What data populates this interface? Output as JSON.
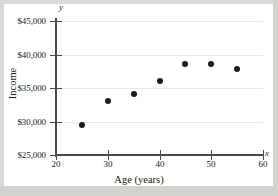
{
  "chart_data": {
    "type": "scatter",
    "title": "",
    "xlabel": "Age (years)",
    "ylabel": "Income",
    "xlim": [
      20,
      60
    ],
    "ylim": [
      25000,
      45000
    ],
    "xticks": [
      20,
      30,
      40,
      50,
      60
    ],
    "yticks": [
      25000,
      30000,
      35000,
      40000,
      45000
    ],
    "xtick_labels": [
      "20",
      "30",
      "40",
      "50",
      "60"
    ],
    "ytick_labels": [
      "$25,000",
      "$30,000",
      "$35,000",
      "$40,000",
      "$45,000"
    ],
    "grid": "horizontal",
    "legend": null,
    "axis_letters": {
      "x": "x",
      "y": "y"
    },
    "marker": {
      "shape": "circle",
      "color": "#1c1c1c",
      "size": 6
    },
    "points": [
      {
        "x": 25,
        "y": 29500
      },
      {
        "x": 30,
        "y": 33100
      },
      {
        "x": 35,
        "y": 34100
      },
      {
        "x": 40,
        "y": 36100
      },
      {
        "x": 45,
        "y": 38600
      },
      {
        "x": 50,
        "y": 38550
      },
      {
        "x": 55,
        "y": 37800
      }
    ]
  },
  "colors": {
    "plot_background": "#ffffff",
    "page_background": "#d8d6d2",
    "axis": "#4a4a4a",
    "gridline": "#e9e9e9",
    "marker": "#1c1c1c",
    "text": "#1a1a1a"
  }
}
